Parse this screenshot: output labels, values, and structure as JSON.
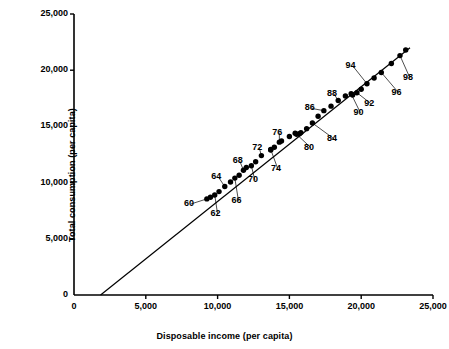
{
  "chart_data": {
    "type": "scatter",
    "title": "",
    "xlabel": "Disposable income (per capita)",
    "ylabel": "Total consumption (per capita)",
    "xlim": [
      0,
      25000
    ],
    "ylim": [
      0,
      25000
    ],
    "xticks": [
      "0",
      "5,000",
      "10,000",
      "15,000",
      "20,000",
      "25,000"
    ],
    "xtick_values": [
      0,
      5000,
      10000,
      15000,
      20000,
      25000
    ],
    "yticks": [
      "0",
      "5,000",
      "10,000",
      "15,000",
      "20,000",
      "25,000"
    ],
    "ytick_values": [
      0,
      5000,
      10000,
      15000,
      20000,
      25000
    ],
    "grid": false,
    "legend": null,
    "series": [
      {
        "name": "Consumption vs disposable income",
        "marker": "filled-circle",
        "color": "#000000",
        "points": [
          {
            "label": "60",
            "x": 9250,
            "y": 8550
          },
          {
            "label": "61",
            "x": 9500,
            "y": 8700
          },
          {
            "label": "62",
            "x": 9800,
            "y": 8900
          },
          {
            "label": "63",
            "x": 10100,
            "y": 9200
          },
          {
            "label": "64",
            "x": 10500,
            "y": 9650
          },
          {
            "label": "65",
            "x": 10900,
            "y": 10050
          },
          {
            "label": "66",
            "x": 11200,
            "y": 10400
          },
          {
            "label": "67",
            "x": 11500,
            "y": 10650
          },
          {
            "label": "68",
            "x": 11800,
            "y": 11100
          },
          {
            "label": "69",
            "x": 12000,
            "y": 11350
          },
          {
            "label": "70",
            "x": 12350,
            "y": 11500
          },
          {
            "label": "71",
            "x": 12650,
            "y": 11850
          },
          {
            "label": "72",
            "x": 13050,
            "y": 12400
          },
          {
            "label": "73",
            "x": 13700,
            "y": 12900
          },
          {
            "label": "74",
            "x": 13700,
            "y": 12950
          },
          {
            "label": "75",
            "x": 13950,
            "y": 13150
          },
          {
            "label": "76",
            "x": 14300,
            "y": 13600
          },
          {
            "label": "77",
            "x": 14450,
            "y": 13700
          },
          {
            "label": "78",
            "x": 15000,
            "y": 14100
          },
          {
            "label": "79",
            "x": 15400,
            "y": 14400
          },
          {
            "label": "80",
            "x": 15500,
            "y": 14300
          },
          {
            "label": "81",
            "x": 15700,
            "y": 14350
          },
          {
            "label": "82",
            "x": 15800,
            "y": 14450
          },
          {
            "label": "83",
            "x": 16200,
            "y": 14800
          },
          {
            "label": "84",
            "x": 16600,
            "y": 15300
          },
          {
            "label": "85",
            "x": 17000,
            "y": 15900
          },
          {
            "label": "86",
            "x": 17400,
            "y": 16400
          },
          {
            "label": "87",
            "x": 17900,
            "y": 16800
          },
          {
            "label": "88",
            "x": 18400,
            "y": 17300
          },
          {
            "label": "89",
            "x": 18900,
            "y": 17700
          },
          {
            "label": "90",
            "x": 19300,
            "y": 17900
          },
          {
            "label": "91",
            "x": 19400,
            "y": 17800
          },
          {
            "label": "92",
            "x": 19700,
            "y": 18000
          },
          {
            "label": "93",
            "x": 20000,
            "y": 18300
          },
          {
            "label": "94",
            "x": 20400,
            "y": 18800
          },
          {
            "label": "95",
            "x": 20900,
            "y": 19300
          },
          {
            "label": "96",
            "x": 21400,
            "y": 19800
          },
          {
            "label": "97",
            "x": 22100,
            "y": 20600
          },
          {
            "label": "98",
            "x": 22700,
            "y": 21300
          },
          {
            "label": "99",
            "x": 23100,
            "y": 21800
          }
        ]
      }
    ],
    "fit_line": {
      "name": "regression-line",
      "color": "#000000",
      "x_start": 1850,
      "y_start": 0,
      "x_end": 23400,
      "y_end": 22000
    },
    "annotations": [
      {
        "text": "60",
        "x": 8150,
        "y": 8100,
        "leader_to_x": 9250,
        "leader_to_y": 8550
      },
      {
        "text": "62",
        "x": 10000,
        "y": 7200,
        "leader_to_x": 9800,
        "leader_to_y": 8900
      },
      {
        "text": "64",
        "x": 10050,
        "y": 10500,
        "leader_to_x": 10500,
        "leader_to_y": 9650
      },
      {
        "text": "66",
        "x": 11450,
        "y": 8400,
        "leader_to_x": 11200,
        "leader_to_y": 10400
      },
      {
        "text": "68",
        "x": 11550,
        "y": 11900,
        "leader_to_x": 11800,
        "leader_to_y": 11100
      },
      {
        "text": "70",
        "x": 12600,
        "y": 10200,
        "leader_to_x": 12350,
        "leader_to_y": 11500
      },
      {
        "text": "72",
        "x": 12900,
        "y": 13100,
        "leader_to_x": 13050,
        "leader_to_y": 12400
      },
      {
        "text": "74",
        "x": 14200,
        "y": 11200,
        "leader_to_x": 13700,
        "leader_to_y": 12950
      },
      {
        "text": "76",
        "x": 14300,
        "y": 14400,
        "leader_to_x": 14300,
        "leader_to_y": 13600
      },
      {
        "text": "80",
        "x": 16500,
        "y": 13100,
        "leader_to_x": 15500,
        "leader_to_y": 14300
      },
      {
        "text": "84",
        "x": 18100,
        "y": 13900,
        "leader_to_x": 16600,
        "leader_to_y": 15300
      },
      {
        "text": "86",
        "x": 16550,
        "y": 16600,
        "leader_to_x": 17400,
        "leader_to_y": 16400
      },
      {
        "text": "88",
        "x": 18100,
        "y": 17900,
        "leader_to_x": 18400,
        "leader_to_y": 17300
      },
      {
        "text": "90",
        "x": 19950,
        "y": 16200,
        "leader_to_x": 19300,
        "leader_to_y": 17900
      },
      {
        "text": "92",
        "x": 20700,
        "y": 17000,
        "leader_to_x": 19700,
        "leader_to_y": 18000
      },
      {
        "text": "94",
        "x": 19400,
        "y": 20400,
        "leader_to_x": 20400,
        "leader_to_y": 18800
      },
      {
        "text": "96",
        "x": 22600,
        "y": 18000,
        "leader_to_x": 21400,
        "leader_to_y": 19800
      },
      {
        "text": "98",
        "x": 23400,
        "y": 19300,
        "leader_to_x": 22700,
        "leader_to_y": 21300
      }
    ]
  }
}
